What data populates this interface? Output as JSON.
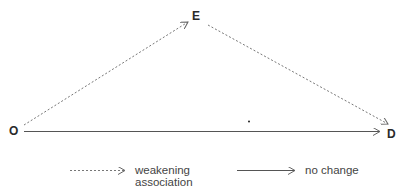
{
  "diagram": {
    "nodes": [
      {
        "id": "O",
        "label": "O",
        "x": 9,
        "y": 125
      },
      {
        "id": "E",
        "label": "E",
        "x": 192,
        "y": 10
      },
      {
        "id": "D",
        "label": "D",
        "x": 387,
        "y": 128
      }
    ],
    "edges": [
      {
        "from": "O",
        "to": "E",
        "style": "dashed",
        "meaning": "weakening association"
      },
      {
        "from": "E",
        "to": "D",
        "style": "dashed",
        "meaning": "weakening association"
      },
      {
        "from": "O",
        "to": "D",
        "style": "solid",
        "meaning": "no change"
      }
    ],
    "colors": {
      "line": "#555555",
      "dashed": "#777777",
      "text": "#333333"
    }
  },
  "legend": {
    "dashed_label_line1": "weakening",
    "dashed_label_line2": "association",
    "solid_label": "no change"
  }
}
